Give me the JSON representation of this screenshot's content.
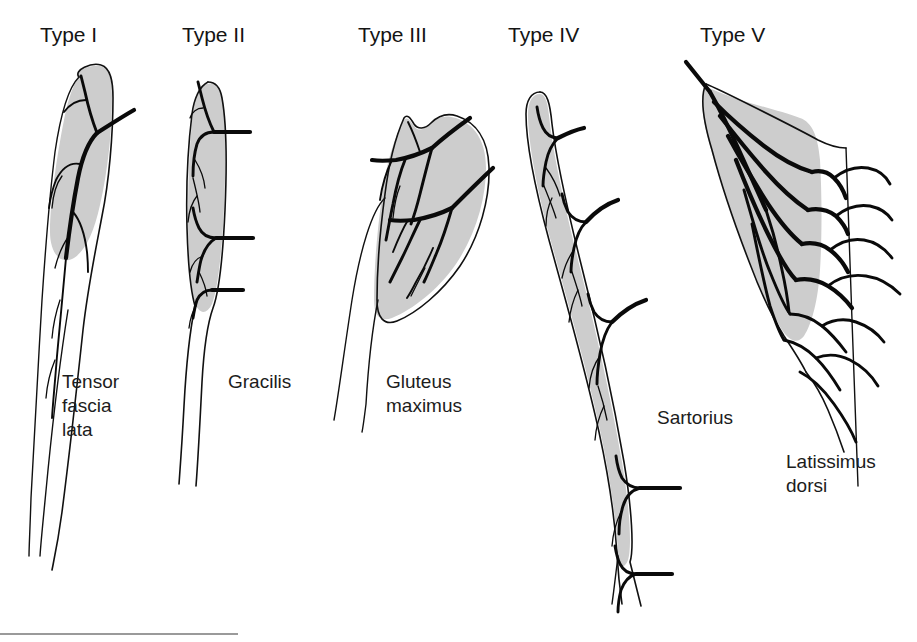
{
  "figure": {
    "background_color": "#ffffff",
    "muscle_fill_color": "#cdcdcd",
    "outline_color": "#111111",
    "vessel_color": "#0a0a0a",
    "text_color": "#1a1a1a",
    "rule_color": "#9a9a9a"
  },
  "panels": [
    {
      "heading": "Type I",
      "muscle_name": "Tensor fascia lata",
      "muscle_name_lines": [
        "Tensor",
        "fascia",
        "lata"
      ],
      "pedicle_count": 1,
      "pedicle_pattern": "one vascular pedicle"
    },
    {
      "heading": "Type II",
      "muscle_name": "Gracilis",
      "muscle_name_lines": [
        "Gracilis"
      ],
      "pedicle_count": 3,
      "pedicle_pattern": "dominant pedicle plus minor pedicles"
    },
    {
      "heading": "Type III",
      "muscle_name": "Gluteus maximus",
      "muscle_name_lines": [
        "Gluteus",
        "maximus"
      ],
      "pedicle_count": 2,
      "pedicle_pattern": "two dominant pedicles"
    },
    {
      "heading": "Type IV",
      "muscle_name": "Sartorius",
      "muscle_name_lines": [
        "Sartorius"
      ],
      "pedicle_count": 6,
      "pedicle_pattern": "segmental vascular pedicles"
    },
    {
      "heading": "Type V",
      "muscle_name": "Latissimus dorsi",
      "muscle_name_lines": [
        "Latissimus",
        "dorsi"
      ],
      "pedicle_count": 7,
      "pedicle_pattern": "one dominant pedicle and secondary segmental pedicles"
    }
  ]
}
